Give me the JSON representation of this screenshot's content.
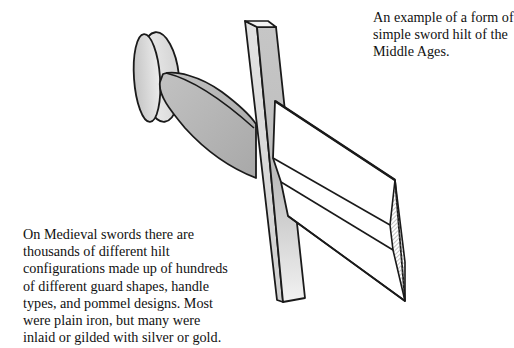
{
  "captions": {
    "top": "An example of a form of\nsimple sword hilt of the\nMiddle Ages.",
    "bottom": "On Medieval swords there are\nthousands of different hilt\nconfigurations made up of hundreds\nof different guard shapes, handle\ntypes, and pommel designs. Most\nwere plain iron, but many were\ninlaid or gilded with silver or gold."
  },
  "diagram": {
    "subject": "sword hilt",
    "parts": [
      "pommel",
      "grip",
      "cross-guard",
      "blade"
    ],
    "colors": {
      "outline": "#1a1a1a",
      "pommel_light": "#e6e6e6",
      "pommel_dark": "#c8c8c8",
      "grip": "#b4b4b4",
      "guard_light": "#dcdcdc",
      "guard_dark": "#bcbcbc",
      "blade": "#ffffff",
      "hatch": "#888888"
    }
  }
}
